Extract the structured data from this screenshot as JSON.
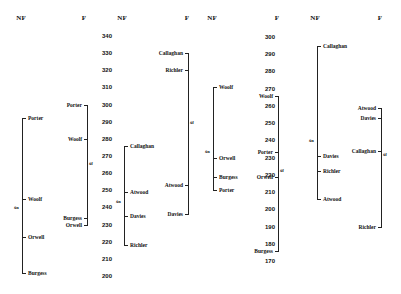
{
  "chart_data": {
    "type": "scatter",
    "title": "",
    "scales": [
      {
        "name": "scale-1",
        "ticks": [
          340,
          330,
          320,
          310,
          300,
          290,
          280,
          270,
          260,
          250,
          240,
          230,
          220,
          210,
          200
        ],
        "range": [
          200,
          340
        ]
      },
      {
        "name": "scale-2",
        "ticks": [
          300,
          290,
          280,
          270,
          260,
          250,
          240,
          230,
          220,
          210,
          200,
          190,
          180,
          170
        ],
        "range": [
          170,
          300
        ]
      }
    ],
    "panels": [
      {
        "scale": 0,
        "NF": {
          "label": "NF",
          "points": [
            {
              "name": "Porter",
              "value": 292
            },
            {
              "name": "Woolf",
              "value": 245
            },
            {
              "name": "Orwell",
              "value": 223
            },
            {
              "name": "Burgess",
              "value": 202
            }
          ],
          "mean_label": "x̄n",
          "mean": 240
        },
        "F": {
          "label": "F",
          "points": [
            {
              "name": "Porter",
              "value": 300
            },
            {
              "name": "Woolf",
              "value": 280
            },
            {
              "name": "Burgess",
              "value": 234
            },
            {
              "name": "Orwell",
              "value": 230
            }
          ],
          "mean_label": "x̄f",
          "mean": 266
        }
      },
      {
        "scale": 0,
        "NF": {
          "label": "NF",
          "points": [
            {
              "name": "Callaghan",
              "value": 276
            },
            {
              "name": "Atwood",
              "value": 249
            },
            {
              "name": "Davies",
              "value": 235
            },
            {
              "name": "Richler",
              "value": 218
            }
          ],
          "mean_label": "x̄n",
          "mean": 244
        },
        "F": {
          "label": "F",
          "points": [
            {
              "name": "Callaghan",
              "value": 330
            },
            {
              "name": "Richler",
              "value": 320
            },
            {
              "name": "Atwood",
              "value": 253
            },
            {
              "name": "Davies",
              "value": 236
            }
          ],
          "mean_label": "x̄f",
          "mean": 290
        }
      },
      {
        "scale": 1,
        "NF": {
          "label": "NF",
          "points": [
            {
              "name": "Woolf",
              "value": 271
            },
            {
              "name": "Orwell",
              "value": 230
            },
            {
              "name": "Burgess",
              "value": 219
            },
            {
              "name": "Porter",
              "value": 211
            }
          ],
          "mean_label": "x̄n",
          "mean": 234
        },
        "F": {
          "label": "F",
          "points": [
            {
              "name": "Woolf",
              "value": 266
            },
            {
              "name": "Porter",
              "value": 233
            },
            {
              "name": "Orwell",
              "value": 219
            },
            {
              "name": "Burgess",
              "value": 176
            }
          ],
          "mean_label": "x̄f",
          "mean": 223
        }
      },
      {
        "scale": 1,
        "NF": {
          "label": "NF",
          "points": [
            {
              "name": "Callaghan",
              "value": 295
            },
            {
              "name": "Davies",
              "value": 231
            },
            {
              "name": "Richler",
              "value": 222
            },
            {
              "name": "Atwood",
              "value": 206
            }
          ],
          "mean_label": "x̄n",
          "mean": 240
        },
        "F": {
          "label": "F",
          "points": [
            {
              "name": "Atwood",
              "value": 259
            },
            {
              "name": "Davies",
              "value": 253
            },
            {
              "name": "Callaghan",
              "value": 234
            },
            {
              "name": "Richler",
              "value": 190
            }
          ],
          "mean_label": "x̄f",
          "mean": 232
        }
      }
    ]
  },
  "headers": [
    "NF",
    "F",
    "NF",
    "F",
    "NF",
    "F",
    "NF",
    "F"
  ]
}
